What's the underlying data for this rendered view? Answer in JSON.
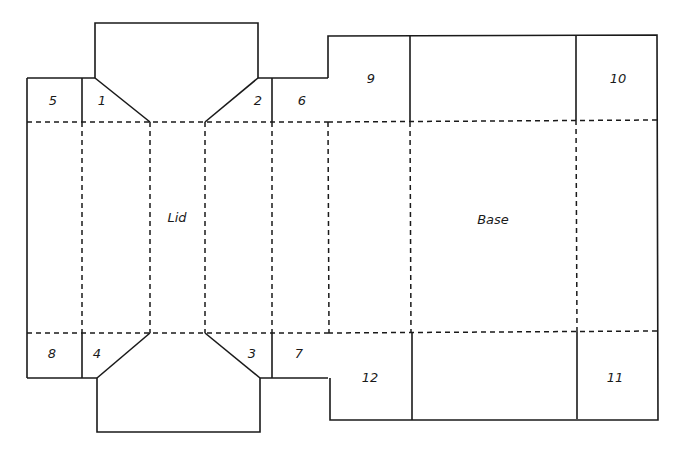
{
  "diagram": {
    "panels": {
      "lid": "Lid",
      "base": "Base"
    },
    "tabs": {
      "t1": "1",
      "t2": "2",
      "t3": "3",
      "t4": "4",
      "t5": "5",
      "t6": "6",
      "t7": "7",
      "t8": "8",
      "t9": "9",
      "t10": "10",
      "t11": "11",
      "t12": "12"
    },
    "legend": {
      "solid": "cut line",
      "dashed": "fold line"
    },
    "colors": {
      "line": "#1a1a1a",
      "background": "#ffffff"
    }
  }
}
